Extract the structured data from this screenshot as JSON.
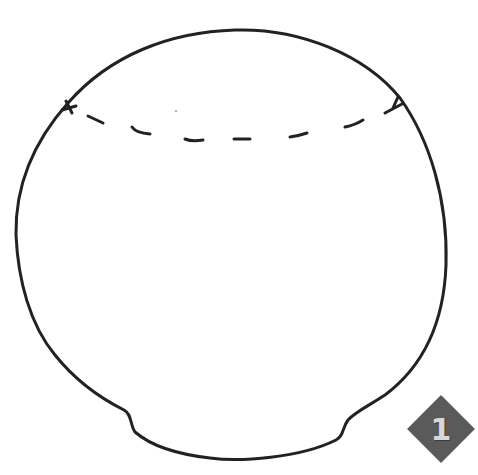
{
  "figure": {
    "shape": "sphere-outline",
    "stroke_color": "#222222",
    "dash_line": "dashed-cap-line",
    "badge": {
      "label": "1",
      "color": "#5a5a5a",
      "text_color": "#d8d8d8"
    }
  }
}
